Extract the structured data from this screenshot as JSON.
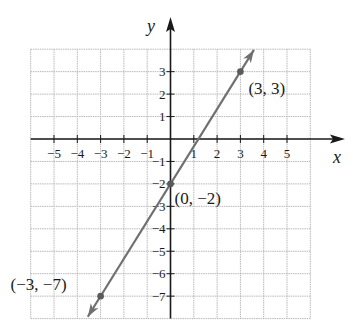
{
  "chart_data": {
    "type": "line",
    "title": "",
    "xlabel": "x",
    "ylabel": "y",
    "xlim": [
      -6,
      6
    ],
    "ylim": [
      -8,
      4
    ],
    "grid": true,
    "x_ticks": [
      -5,
      -4,
      -3,
      -2,
      -1,
      1,
      2,
      3,
      4,
      5
    ],
    "y_ticks": [
      3,
      2,
      1,
      -1,
      -2,
      -3,
      -4,
      -5,
      -6,
      -7
    ],
    "x_tick_labels": [
      "−5",
      "−4",
      "−3",
      "−2",
      "−1",
      "1",
      "2",
      "3",
      "4",
      "5"
    ],
    "y_tick_labels": [
      "3",
      "2",
      "1",
      "−1",
      "−2",
      "−3",
      "−4",
      "−5",
      "−6",
      "−7"
    ],
    "series": [
      {
        "name": "y = (5/3)x − 2",
        "type": "line-with-arrows",
        "color": "#707070",
        "x": [
          -3,
          0,
          3
        ],
        "y": [
          -7,
          -2,
          3
        ]
      }
    ],
    "points": [
      {
        "x": 3,
        "y": 3,
        "label": "(3, 3)"
      },
      {
        "x": 0,
        "y": -2,
        "label": "(0, −2)"
      },
      {
        "x": -3,
        "y": -7,
        "label": "(−3, −7)"
      }
    ],
    "colors": {
      "grid": "#b8b8b8",
      "axis": "#1a1a1a",
      "line": "#707070",
      "text": "#1a1a1a"
    }
  }
}
